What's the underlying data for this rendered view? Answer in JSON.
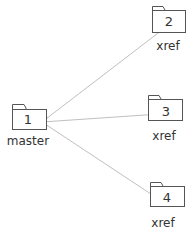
{
  "diagram": {
    "type": "folder-reference-tree",
    "colors": {
      "line": "#c0c0c0",
      "folder_stroke": "#555555",
      "text": "#333333",
      "background": "#ffffff"
    },
    "master": {
      "number": "1",
      "label": "master"
    },
    "nodes": [
      {
        "number": "2",
        "label": "xref"
      },
      {
        "number": "3",
        "label": "xref"
      },
      {
        "number": "4",
        "label": "xref"
      }
    ],
    "edges": [
      {
        "from": "1",
        "to": "2"
      },
      {
        "from": "1",
        "to": "3"
      },
      {
        "from": "1",
        "to": "4"
      }
    ]
  }
}
